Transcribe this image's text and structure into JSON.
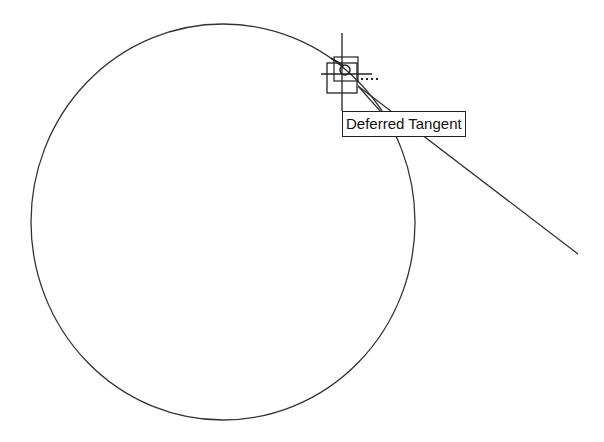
{
  "app": {
    "type": "CAD drawing canvas"
  },
  "drawing": {
    "circle": {
      "cx": 223,
      "cy": 222,
      "rx": 192,
      "ry": 198,
      "stroke": "#333333"
    },
    "rubber_band_line": {
      "x1": 358,
      "y1": 86,
      "x2": 578,
      "y2": 254,
      "stroke": "#333333"
    },
    "cursor": {
      "x": 342,
      "y": 72,
      "snap_marker": "deferred-tangent"
    }
  },
  "tooltip": {
    "label": "Deferred Tangent"
  }
}
